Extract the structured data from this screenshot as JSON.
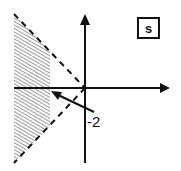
{
  "diagram": {
    "plane_label": "s",
    "annotation_label": "-2",
    "colors": {
      "ink": "#111111",
      "hatch": "#555555",
      "background": "#ffffff"
    },
    "elements": {
      "axes": [
        "real-axis",
        "imaginary-axis"
      ],
      "boundary_lines": [
        "upper-dashed-line",
        "lower-dashed-line"
      ],
      "shaded_region": "hatched-left-region",
      "pointer": "arrow-to-minus-2"
    }
  }
}
